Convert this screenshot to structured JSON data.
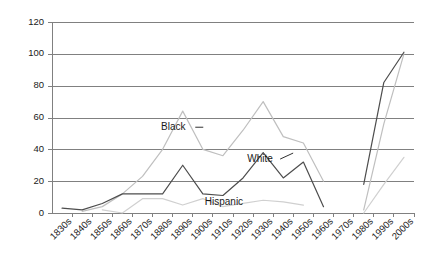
{
  "chart_data": {
    "type": "line",
    "title": "",
    "xlabel": "",
    "ylabel": "",
    "ylim": [
      0,
      120
    ],
    "yticks": [
      0,
      20,
      40,
      60,
      80,
      100,
      120
    ],
    "grid": true,
    "legend_position": "inline-annotations",
    "categories": [
      "1830s",
      "1840s",
      "1850s",
      "1860s",
      "1870s",
      "1880s",
      "1890s",
      "1900s",
      "1910s",
      "1920s",
      "1930s",
      "1940s",
      "1950s",
      "1960s",
      "1970s",
      "1980s",
      "1990s",
      "2000s"
    ],
    "series": [
      {
        "name": "Black",
        "color": "#d0d0d0",
        "values": [
          null,
          null,
          2,
          0,
          9,
          9,
          5,
          9,
          4,
          6,
          8,
          7,
          5,
          null,
          null,
          0,
          18,
          35
        ]
      },
      {
        "name": "White",
        "color": "#4d4d4d",
        "values": [
          3,
          2,
          6,
          12,
          12,
          12,
          30,
          12,
          11,
          22,
          38,
          22,
          32,
          4,
          null,
          18,
          82,
          101
        ]
      },
      {
        "name": "Hispanic",
        "color": "#bfbfbf",
        "values": [
          null,
          1,
          4,
          12,
          23,
          40,
          64,
          40,
          36,
          52,
          70,
          48,
          44,
          20,
          null,
          2,
          56,
          100
        ]
      }
    ],
    "annotations": [
      {
        "text": "Black",
        "x_pct": 0.335,
        "y_value": 52
      },
      {
        "text": "White",
        "x_pct": 0.575,
        "y_value": 32
      },
      {
        "text": "Hispanic",
        "x_pct": 0.475,
        "y_value": 5
      }
    ]
  }
}
